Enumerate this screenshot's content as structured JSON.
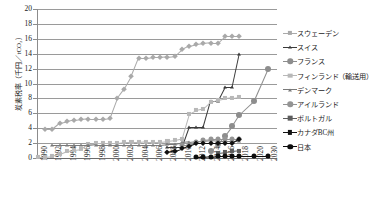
{
  "chart_data": {
    "type": "line",
    "title": "",
    "xlabel": "",
    "ylabel": "炭素税率（千円／tCO₂）",
    "ylim": [
      0,
      20
    ],
    "yticks": [
      0,
      2,
      4,
      6,
      8,
      10,
      12,
      14,
      16,
      18,
      20
    ],
    "grid": true,
    "legend_position": "right",
    "xlim": [
      1990,
      2030
    ],
    "xticks": [
      "1990",
      "1992",
      "1994",
      "1996",
      "1998",
      "2000",
      "2002",
      "2004",
      "2006",
      "2008",
      "2010",
      "2012",
      "2014",
      "2016",
      "2018",
      "2020",
      "2030"
    ],
    "series": [
      {
        "name": "スウェーデン",
        "color": "#a9a9a9",
        "marker": "diamond",
        "x": [
          1991,
          1992,
          1993,
          1994,
          1995,
          1996,
          1997,
          1998,
          1999,
          2000,
          2001,
          2002,
          2003,
          2004,
          2005,
          2006,
          2007,
          2008,
          2009,
          2010,
          2011,
          2012,
          2013,
          2014,
          2015,
          2016,
          2017,
          2018
        ],
        "y": [
          3.9,
          3.9,
          4.7,
          4.9,
          5.1,
          5.2,
          5.3,
          5.3,
          5.3,
          5.4,
          8.0,
          9.3,
          11.0,
          13.4,
          13.4,
          13.5,
          13.5,
          13.6,
          13.7,
          14.6,
          15.1,
          15.3,
          15.4,
          15.5,
          15.5,
          16.4,
          16.4,
          16.4
        ]
      },
      {
        "name": "スイス",
        "color": "#3a3a3a",
        "marker": "triangle",
        "x": [
          2008,
          2009,
          2010,
          2011,
          2012,
          2013,
          2014,
          2015,
          2016,
          2017,
          2018
        ],
        "y": [
          1.5,
          1.5,
          1.5,
          4.2,
          4.2,
          4.2,
          7.6,
          7.6,
          9.5,
          9.5,
          14.0
        ]
      },
      {
        "name": "フランス",
        "color": "#8d8d8d",
        "marker": "circle",
        "x": [
          2014,
          2015,
          2016,
          2017,
          2018,
          2020,
          2030
        ],
        "y": [
          1.0,
          1.9,
          3.0,
          4.3,
          5.8,
          7.6,
          12.0
        ]
      },
      {
        "name": "フィンランド（輸送用）",
        "color": "#b8b8b8",
        "marker": "square",
        "x": [
          1990,
          1991,
          1992,
          1993,
          1994,
          1995,
          1996,
          1997,
          1998,
          1999,
          2000,
          2001,
          2002,
          2003,
          2004,
          2005,
          2006,
          2007,
          2008,
          2009,
          2010,
          2011,
          2012,
          2013,
          2014,
          2015,
          2016,
          2017,
          2018
        ],
        "y": [
          0.2,
          0.2,
          0.3,
          0.6,
          1.0,
          1.1,
          1.2,
          1.9,
          2.0,
          2.0,
          2.0,
          2.0,
          2.1,
          2.1,
          2.1,
          2.2,
          2.2,
          2.2,
          2.3,
          2.4,
          2.6,
          5.9,
          6.4,
          6.6,
          7.5,
          7.8,
          8.0,
          8.1,
          8.2
        ]
      },
      {
        "name": "デンマーク",
        "color": "#7a7a7a",
        "marker": "triangle",
        "x": [
          1992,
          1993,
          1994,
          1995,
          1996,
          1997,
          1998,
          1999,
          2000,
          2001,
          2002,
          2003,
          2004,
          2005,
          2006,
          2007,
          2008,
          2009,
          2010,
          2011,
          2012,
          2013,
          2014,
          2015,
          2016,
          2017,
          2018
        ],
        "y": [
          1.7,
          1.7,
          1.7,
          1.7,
          1.7,
          1.7,
          1.8,
          1.8,
          1.8,
          1.8,
          1.8,
          1.8,
          1.8,
          1.8,
          1.8,
          1.8,
          1.9,
          1.9,
          2.1,
          2.2,
          2.3,
          2.3,
          2.4,
          2.3,
          2.3,
          2.3,
          2.3
        ]
      },
      {
        "name": "アイルランド",
        "color": "#949494",
        "marker": "circle",
        "x": [
          2010,
          2011,
          2012,
          2013,
          2014,
          2015,
          2016,
          2017,
          2018
        ],
        "y": [
          1.8,
          1.8,
          2.2,
          2.4,
          2.5,
          2.5,
          2.5,
          2.5,
          2.5
        ]
      },
      {
        "name": "ポルトガル",
        "color": "#5d5d5d",
        "marker": "square",
        "x": [
          2015,
          2016,
          2017,
          2018
        ],
        "y": [
          0.7,
          0.8,
          0.9,
          1.0
        ]
      },
      {
        "name": "カナダBC州",
        "color": "#111111",
        "marker": "diamond",
        "x": [
          2008,
          2009,
          2010,
          2011,
          2012,
          2013,
          2014,
          2015,
          2016,
          2017,
          2018
        ],
        "y": [
          0.8,
          1.0,
          1.3,
          1.6,
          2.0,
          2.0,
          2.0,
          2.0,
          2.0,
          2.0,
          2.6
        ]
      },
      {
        "name": "日本",
        "color": "#0d0d0d",
        "marker": "circle",
        "x": [
          2012,
          2013,
          2014,
          2015,
          2016,
          2017,
          2018,
          2020,
          2030
        ],
        "y": [
          0.1,
          0.1,
          0.2,
          0.3,
          0.3,
          0.3,
          0.3,
          0.3,
          0.3
        ]
      }
    ]
  }
}
